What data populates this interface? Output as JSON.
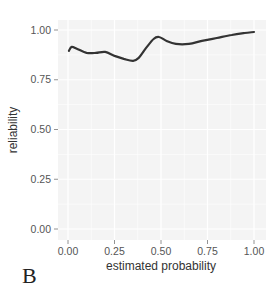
{
  "chart_data": {
    "type": "line",
    "title": "",
    "panel_label": "B",
    "xlabel": "estimated probability",
    "ylabel": "reliability",
    "xlim": [
      0,
      1
    ],
    "ylim": [
      0,
      1
    ],
    "x_ticks": [
      "0.00",
      "0.25",
      "0.50",
      "0.75",
      "1.00"
    ],
    "y_ticks": [
      "0.00",
      "0.25",
      "0.50",
      "0.75",
      "1.00"
    ],
    "grid": true,
    "legend": null,
    "series": [
      {
        "name": "reliability",
        "color": "#333333",
        "x": [
          0.005,
          0.02,
          0.05,
          0.1,
          0.15,
          0.2,
          0.25,
          0.3,
          0.35,
          0.38,
          0.42,
          0.46,
          0.49,
          0.53,
          0.58,
          0.65,
          0.72,
          0.8,
          0.88,
          0.95,
          1.0
        ],
        "y": [
          0.895,
          0.915,
          0.905,
          0.885,
          0.885,
          0.89,
          0.87,
          0.855,
          0.845,
          0.86,
          0.91,
          0.955,
          0.965,
          0.945,
          0.93,
          0.93,
          0.945,
          0.96,
          0.975,
          0.985,
          0.99
        ]
      }
    ]
  },
  "axes": {
    "x_title": "estimated probability",
    "y_title": "reliability",
    "panel_label": "B"
  }
}
